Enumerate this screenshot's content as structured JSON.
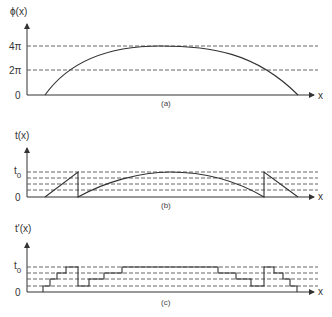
{
  "figure": {
    "panels": [
      {
        "id": "a",
        "caption": "(a)",
        "y_label": "ϕ(x)",
        "x_label": "x",
        "y_ticks": [
          "4π",
          "2π",
          "0"
        ]
      },
      {
        "id": "b",
        "caption": "(b)",
        "y_label": "t(x)",
        "x_label": "x",
        "y_ticks": [
          "t",
          "0",
          "0"
        ],
        "y_tick_t0_main": "t",
        "y_tick_t0_sub": "0",
        "y_tick_zero": "0"
      },
      {
        "id": "c",
        "caption": "(c)",
        "y_label": "t'(x)",
        "x_label": "x",
        "y_tick_t0_main": "t",
        "y_tick_t0_sub": "0",
        "y_tick_zero": "0"
      }
    ]
  },
  "colors": {
    "line": "#333333",
    "dashed": "#555555",
    "background": "#ffffff"
  }
}
